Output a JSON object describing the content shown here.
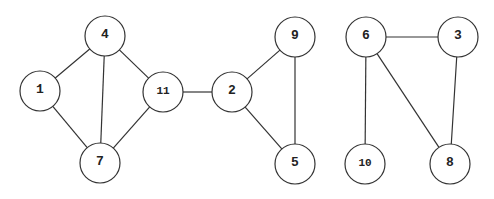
{
  "graph": {
    "nodes": [
      {
        "id": "4",
        "label": "4",
        "x": 105,
        "y": 36
      },
      {
        "id": "1",
        "label": "1",
        "x": 40,
        "y": 91
      },
      {
        "id": "11",
        "label": "11",
        "x": 163,
        "y": 92
      },
      {
        "id": "7",
        "label": "7",
        "x": 100,
        "y": 163
      },
      {
        "id": "2",
        "label": "2",
        "x": 232,
        "y": 92
      },
      {
        "id": "9",
        "label": "9",
        "x": 295,
        "y": 37
      },
      {
        "id": "5",
        "label": "5",
        "x": 295,
        "y": 164
      },
      {
        "id": "6",
        "label": "6",
        "x": 366,
        "y": 37
      },
      {
        "id": "3",
        "label": "3",
        "x": 458,
        "y": 37
      },
      {
        "id": "10",
        "label": "10",
        "x": 365,
        "y": 164
      },
      {
        "id": "8",
        "label": "8",
        "x": 450,
        "y": 164
      }
    ],
    "edges": [
      [
        "4",
        "1"
      ],
      [
        "4",
        "7"
      ],
      [
        "4",
        "11"
      ],
      [
        "1",
        "7"
      ],
      [
        "11",
        "7"
      ],
      [
        "11",
        "2"
      ],
      [
        "2",
        "9"
      ],
      [
        "2",
        "5"
      ],
      [
        "9",
        "5"
      ],
      [
        "6",
        "3"
      ],
      [
        "6",
        "10"
      ],
      [
        "6",
        "8"
      ],
      [
        "3",
        "8"
      ]
    ],
    "node_radius": 20
  }
}
